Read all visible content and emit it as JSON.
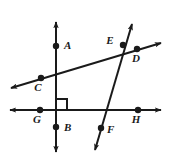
{
  "figure": {
    "title": "",
    "type": "geometry-line-diagram",
    "stroke_color": "#1a1a1a",
    "background_color": "#ffffff",
    "width": 171,
    "height": 160
  },
  "points": [
    {
      "id": "A",
      "label": "A",
      "x": 56,
      "y": 46,
      "label_x": 64,
      "label_y": 49
    },
    {
      "id": "B",
      "label": "B",
      "x": 56,
      "y": 127,
      "label_x": 64,
      "label_y": 131
    },
    {
      "id": "C",
      "label": "C",
      "x": 41,
      "y": 78,
      "label_x": 38,
      "label_y": 91
    },
    {
      "id": "D",
      "label": "D",
      "x": 137,
      "y": 49,
      "label_x": 136,
      "label_y": 62
    },
    {
      "id": "E",
      "label": "E",
      "x": 123,
      "y": 45,
      "label_x": 110,
      "label_y": 44
    },
    {
      "id": "F",
      "label": "F",
      "x": 101,
      "y": 128,
      "label_x": 107,
      "label_y": 133
    },
    {
      "id": "G",
      "label": "G",
      "x": 40,
      "y": 110,
      "label_x": 37,
      "label_y": 123
    },
    {
      "id": "H",
      "label": "H",
      "x": 138,
      "y": 110,
      "label_x": 136,
      "label_y": 123
    }
  ],
  "lines": [
    {
      "id": "vertical-line-AB",
      "name": "vertical line through A and B",
      "x1": 56,
      "y1": 22,
      "x2": 56,
      "y2": 152,
      "arrow_start": true,
      "arrow_end": true
    },
    {
      "id": "horizontal-line-GH",
      "name": "horizontal line through G and H",
      "x1": 10,
      "y1": 110,
      "x2": 161,
      "y2": 110,
      "arrow_start": true,
      "arrow_end": true
    },
    {
      "id": "diagonal-line-CED",
      "name": "rising diagonal line through C, E and D",
      "x1": 11,
      "y1": 88,
      "x2": 161,
      "y2": 43,
      "arrow_start": true,
      "arrow_end": true
    },
    {
      "id": "steep-line-EF",
      "name": "steep transversal line through E and F",
      "x1": 132,
      "y1": 24,
      "x2": 95,
      "y2": 150,
      "arrow_start": true,
      "arrow_end": true
    }
  ],
  "markers": [
    {
      "id": "right-angle-GB-vertical",
      "name": "right angle square at intersection of vertical and horizontal lines",
      "x": 56,
      "y": 110,
      "size": 11,
      "dir_x": 1,
      "dir_y": -1
    }
  ]
}
